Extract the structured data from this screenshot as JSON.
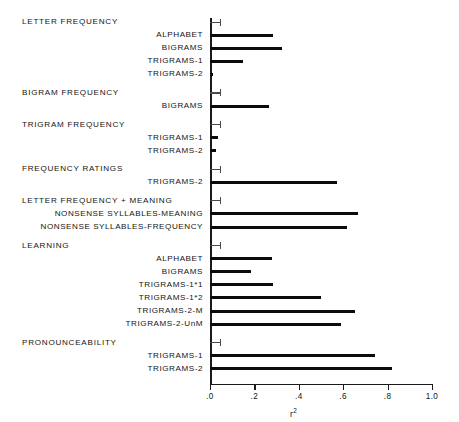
{
  "chart_data": {
    "type": "bar",
    "orientation": "horizontal",
    "title": "",
    "xlabel": "r2",
    "xlabel_display": "r²",
    "ylabel": "",
    "xlim": [
      0.0,
      1.0
    ],
    "xticks": [
      0.0,
      0.2,
      0.4,
      0.6,
      0.8,
      1.0
    ],
    "xticklabels": [
      ".0",
      ".2",
      ".4",
      ".6",
      ".8",
      "1.0"
    ],
    "grid": false,
    "legend": "none",
    "groups": [
      {
        "name": "LETTER FREQUENCY",
        "categories": [
          "ALPHABET",
          "BIGRAMS",
          "TRIGRAMS-1",
          "TRIGRAMS-2"
        ],
        "values": [
          0.285,
          0.325,
          0.15,
          0.015
        ]
      },
      {
        "name": "BIGRAM FREQUENCY",
        "categories": [
          "BIGRAMS"
        ],
        "values": [
          0.265
        ]
      },
      {
        "name": "TRIGRAM  FREQUENCY",
        "categories": [
          "TRIGRAMS-1",
          "TRIGRAMS-2"
        ],
        "values": [
          0.035,
          0.025
        ]
      },
      {
        "name": "FREQUENCY RATINGS",
        "categories": [
          "TRIGRAMS-2"
        ],
        "values": [
          0.57
        ]
      },
      {
        "name": "LETTER FREQUENCY + MEANING",
        "categories": [
          "NONSENSE SYLLABLES-MEANING",
          "NONSENSE SYLLABLES-FREQUENCY"
        ],
        "values": [
          0.665,
          0.615
        ]
      },
      {
        "name": "LEARNING",
        "categories": [
          "ALPHABET",
          "BIGRAMS",
          "TRIGRAMS-1*1",
          "TRIGRAMS-1*2",
          "TRIGRAMS-2-M",
          "TRIGRAMS-2-UnM"
        ],
        "values": [
          0.28,
          0.185,
          0.285,
          0.5,
          0.655,
          0.59
        ]
      },
      {
        "name": "PRONOUNCEABILITY",
        "categories": [
          "TRIGRAMS-1",
          "TRIGRAMS-2"
        ],
        "values": [
          0.745,
          0.82
        ]
      }
    ]
  },
  "colors": {
    "bar": "#0b0b0b",
    "axis": "#1a1a1a",
    "text": "#141414",
    "background": "#ffffff"
  }
}
